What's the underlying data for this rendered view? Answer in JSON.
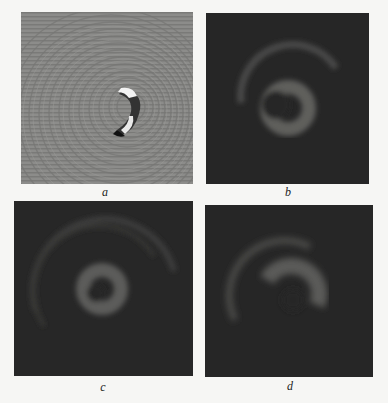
{
  "figure": {
    "panels": [
      {
        "id": "a",
        "label": "a",
        "description": "phase map with spiral fringes and crescent-shaped vortex core"
      },
      {
        "id": "b",
        "label": "b",
        "description": "intensity map: bright crescent core with faint outer arc ring"
      },
      {
        "id": "c",
        "label": "c",
        "description": "intensity map: bright ring core with faint outer ring arcs"
      },
      {
        "id": "d",
        "label": "d",
        "description": "intensity map: diffuse crescent core with faint outer arc"
      }
    ],
    "colors": {
      "background": "#f6f6f4",
      "phase_gray": "#8a8a88",
      "intensity_dark": "#262626",
      "ring_glow": "#5a5a58"
    }
  }
}
